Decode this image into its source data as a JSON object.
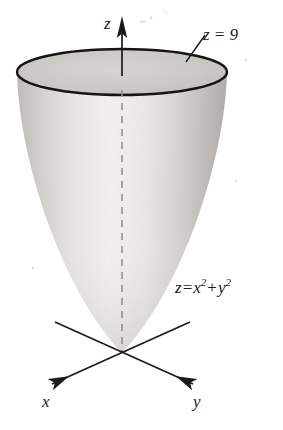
{
  "figure": {
    "background_color": "#ffffff",
    "ink_color": "#1a1a1a",
    "labels": {
      "z_axis": "z",
      "x_axis": "x",
      "y_axis": "y",
      "top_plane": "z = 9",
      "equation_lhs": "z",
      "equation_eq": "=",
      "equation_term1_base": "x",
      "equation_term1_exp": "2",
      "equation_plus": "+",
      "equation_term2_base": "y",
      "equation_term2_exp": "2",
      "equation_full": "z = x2 + y2"
    },
    "surface": {
      "name": "circular paraboloid",
      "fill_light": "#f3f2f0",
      "fill_mid": "#d6d4d1",
      "fill_dark": "#b4b1ae",
      "rim_stroke": "#141414",
      "rim_stroke_width": 2.4,
      "cap_fill": "#cbc9c6"
    },
    "geometry": {
      "rim_center_x": 122,
      "rim_center_y": 72,
      "rim_radius_x": 105,
      "rim_radius_y": 23,
      "vertex_x": 122,
      "vertex_y": 353,
      "axis_dash_top_y": 90,
      "axis_dash_bottom_y": 353
    },
    "axes": [
      {
        "name": "z",
        "direction": "up",
        "arrow": "solid-triangle",
        "tip_x": 122,
        "tip_y": 18,
        "tail_x": 122,
        "tail_y": 75
      },
      {
        "name": "x",
        "direction": "down-left",
        "arrow": "barbed",
        "tip_x": 47,
        "tip_y": 386,
        "tail_x": 190,
        "tail_y": 322
      },
      {
        "name": "y",
        "direction": "down-right",
        "arrow": "barbed",
        "tip_x": 198,
        "tip_y": 386,
        "tail_x": 55,
        "tail_y": 322
      }
    ],
    "leader_line": {
      "name": "z-equals-9-leader",
      "from_x": 186,
      "from_y": 62,
      "to_x": 204,
      "to_y": 36
    }
  }
}
